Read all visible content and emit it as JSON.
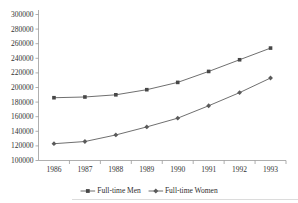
{
  "chart_data": {
    "type": "line",
    "title": "",
    "xlabel": "",
    "ylabel": "",
    "categories": [
      "1986",
      "1987",
      "1988",
      "1989",
      "1990",
      "1991",
      "1992",
      "1993"
    ],
    "series": [
      {
        "name": "Full-time Men",
        "marker": "square",
        "values": [
          186000,
          187000,
          190000,
          197000,
          207000,
          222000,
          238000,
          254000
        ]
      },
      {
        "name": "Full-time Women",
        "marker": "diamond",
        "values": [
          123000,
          126000,
          135000,
          146000,
          158000,
          175000,
          193000,
          213000
        ]
      }
    ],
    "ylim": [
      100000,
      300000
    ],
    "y_ticks": [
      100000,
      120000,
      140000,
      160000,
      180000,
      200000,
      220000,
      240000,
      260000,
      280000,
      300000
    ],
    "y_tick_labels": [
      "100000",
      "120000",
      "140000",
      "160000",
      "180000",
      "200000",
      "220000",
      "240000",
      "260000",
      "280000",
      "300000"
    ],
    "grid": false,
    "legend_position": "bottom",
    "colors": {
      "series_line": "#5f5f5f",
      "men_marker": "#474747",
      "women_marker": "#5a5a5a",
      "axis": "#9a9a9a",
      "text": "#333333"
    }
  }
}
